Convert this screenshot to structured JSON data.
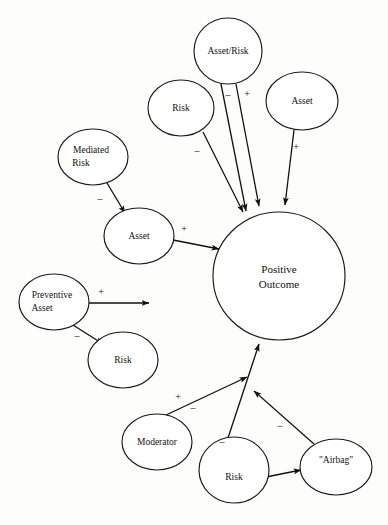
{
  "diagram": {
    "background_color": "#fdfdfc",
    "stroke_color": "#111111",
    "nodes": [
      {
        "id": "asset_risk",
        "label": "Asset/Risk",
        "cx": 228,
        "cy": 51,
        "rx": 34,
        "ry": 33
      },
      {
        "id": "risk_top",
        "label": "Risk",
        "cx": 181,
        "cy": 108,
        "rx": 33,
        "ry": 28
      },
      {
        "id": "asset_top",
        "label": "Asset",
        "cx": 302,
        "cy": 101,
        "rx": 36,
        "ry": 29
      },
      {
        "id": "mediated_risk",
        "label_line1": "Mediated",
        "label_line2": "Risk",
        "cx": 93,
        "cy": 157,
        "rx": 35,
        "ry": 28
      },
      {
        "id": "asset_mid",
        "label": "Asset",
        "cx": 139,
        "cy": 236,
        "rx": 35,
        "ry": 28
      },
      {
        "id": "positive_outcome",
        "label_line1": "Positive",
        "label_line2": "Outcome",
        "cx": 279,
        "cy": 276,
        "rx": 66,
        "ry": 64
      },
      {
        "id": "preventive_asset",
        "label_line1": "Preventive",
        "label_line2": "Asset",
        "cx": 54,
        "cy": 302,
        "rx": 35,
        "ry": 28
      },
      {
        "id": "risk_left",
        "label": "Risk",
        "cx": 123,
        "cy": 360,
        "rx": 35,
        "ry": 28
      },
      {
        "id": "moderator",
        "label": "Moderator",
        "cx": 157,
        "cy": 442,
        "rx": 35,
        "ry": 28
      },
      {
        "id": "risk_bottom",
        "label": "Risk",
        "cx": 234,
        "cy": 470,
        "rx": 35,
        "ry": 33
      },
      {
        "id": "airbag",
        "label": "\"Airbag\"",
        "cx": 336,
        "cy": 467,
        "rx": 36,
        "ry": 28
      }
    ],
    "edges": [
      {
        "id": "e1",
        "from": "asset_risk",
        "to": "positive_outcome",
        "sign": "–",
        "sign_x": 228,
        "sign_y": 96,
        "x1": 221,
        "y1": 84,
        "x2": 246,
        "y2": 211
      },
      {
        "id": "e2",
        "from": "asset_risk",
        "to": "positive_outcome",
        "sign": "+",
        "sign_x": 247,
        "sign_y": 95,
        "x1": 236,
        "y1": 84,
        "x2": 259,
        "y2": 206
      },
      {
        "id": "e3",
        "from": "risk_top",
        "to": "positive_outcome",
        "sign": "–",
        "sign_x": 197,
        "sign_y": 152,
        "x1": 203,
        "y1": 132,
        "x2": 243,
        "y2": 212
      },
      {
        "id": "e4",
        "from": "asset_top",
        "to": "positive_outcome",
        "sign": "+",
        "sign_x": 296,
        "sign_y": 148,
        "x1": 294,
        "y1": 130,
        "x2": 285,
        "y2": 205
      },
      {
        "id": "e5",
        "from": "mediated_risk",
        "to": "asset_mid",
        "sign": "–",
        "sign_x": 100,
        "sign_y": 200,
        "x1": 107,
        "y1": 183,
        "x2": 124,
        "y2": 212
      },
      {
        "id": "e6",
        "from": "asset_mid",
        "to": "positive_outcome",
        "sign": "+",
        "sign_x": 184,
        "sign_y": 230,
        "x1": 173,
        "y1": 240,
        "x2": 218,
        "y2": 249
      },
      {
        "id": "e7",
        "from": "preventive_asset",
        "to": "",
        "sign": "+",
        "sign_x": 101,
        "sign_y": 293,
        "x1": 89,
        "y1": 303,
        "x2": 148,
        "y2": 303
      },
      {
        "id": "e8",
        "from": "preventive_asset",
        "to": "risk_left",
        "sign": "–",
        "sign_x": 77,
        "sign_y": 337,
        "x1": 73,
        "y1": 325,
        "x2": 102,
        "y2": 343
      },
      {
        "id": "e9",
        "from": "moderator",
        "to": "positive_outcome",
        "sign": "+",
        "sign_x": 178,
        "sign_y": 398,
        "x1": 167,
        "y1": 416,
        "x2": 246,
        "y2": 376
      },
      {
        "id": "e10",
        "from": "moderator",
        "to": "",
        "sign": "–",
        "sign_x": 193,
        "sign_y": 409,
        "x1": 0,
        "y1": 0,
        "x2": 0,
        "y2": 0
      },
      {
        "id": "e11",
        "from": "risk_bottom",
        "to": "positive_outcome",
        "sign": "–",
        "sign_x": 222,
        "sign_y": 443,
        "x1": 228,
        "y1": 438,
        "x2": 259,
        "y2": 343
      },
      {
        "id": "e12",
        "from": "airbag",
        "to": "positive_outcome",
        "sign": "–",
        "sign_x": 280,
        "sign_y": 427,
        "x1": 314,
        "y1": 444,
        "x2": 253,
        "y2": 390
      },
      {
        "id": "e13",
        "from": "risk_bottom",
        "to": "airbag",
        "sign": "",
        "sign_x": 0,
        "sign_y": 0,
        "x1": 266,
        "y1": 477,
        "x2": 300,
        "y2": 470
      }
    ]
  }
}
